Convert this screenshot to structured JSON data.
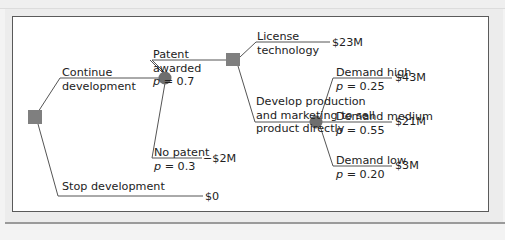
{
  "colors": {
    "node_fill": "#7f7f7f",
    "line": "#555555",
    "text": "#222222",
    "panel_bg": "#ffffff",
    "frame_bg": "#ececec"
  },
  "legend": {
    "decision_node": "square",
    "chance_node": "circle"
  },
  "nodes": {
    "root": {
      "type": "decision",
      "shape": "square"
    },
    "patent_chance": {
      "type": "chance",
      "shape": "circle"
    },
    "license_decision": {
      "type": "decision",
      "shape": "square"
    },
    "demand_chance": {
      "type": "chance",
      "shape": "circle"
    }
  },
  "branches": {
    "continue": {
      "label_line1": "Continue",
      "label_line2": "development"
    },
    "stop": {
      "label": "Stop development",
      "payoff": "$0"
    },
    "patent_awarded": {
      "label_line1": "Patent",
      "label_line2": "awarded",
      "prob_sym": "p",
      "prob": "= 0.7"
    },
    "no_patent": {
      "label": "No patent",
      "prob_sym": "p",
      "prob": "= 0.3",
      "payoff": "−$2M"
    },
    "license": {
      "label_line1": "License",
      "label_line2": "technology",
      "payoff": "$23M"
    },
    "develop": {
      "label_line1": "Develop production",
      "label_line2": "and marketing to sell",
      "label_line3": "product directly"
    },
    "demand_high": {
      "label": "Demand high",
      "prob_sym": "p",
      "prob": "= 0.25",
      "payoff": "$43M"
    },
    "demand_medium": {
      "label": "Demand medium",
      "prob_sym": "p",
      "prob": "= 0.55",
      "payoff": "$21M"
    },
    "demand_low": {
      "label": "Demand low",
      "prob_sym": "p",
      "prob": "= 0.20",
      "payoff": "$3M"
    }
  }
}
